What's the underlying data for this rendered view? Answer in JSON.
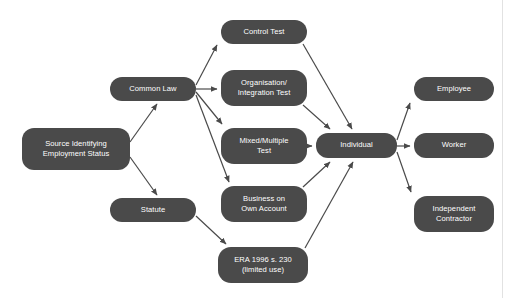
{
  "diagram": {
    "node_fill": "#4a4a4a",
    "node_text_color": "#ffffff",
    "edge_color": "#4a4a4a",
    "background": "#ffffff",
    "divider_color": "#e2e2e2",
    "nodes": [
      {
        "id": "source",
        "label": "Source Identifying\nEmployment Status",
        "x": 22,
        "y": 128,
        "w": 108,
        "h": 42
      },
      {
        "id": "common_law",
        "label": "Common Law",
        "x": 110,
        "y": 77,
        "w": 86,
        "h": 24
      },
      {
        "id": "statute",
        "label": "Statute",
        "x": 110,
        "y": 198,
        "w": 86,
        "h": 24
      },
      {
        "id": "control_test",
        "label": "Control Test",
        "x": 221,
        "y": 20,
        "w": 86,
        "h": 24
      },
      {
        "id": "organisation_test",
        "label": "Organisation/\nIntegration Test",
        "x": 221,
        "y": 70,
        "w": 86,
        "h": 36
      },
      {
        "id": "mixed_test",
        "label": "Mixed/Multiple\nTest",
        "x": 221,
        "y": 128,
        "w": 86,
        "h": 36
      },
      {
        "id": "business_own_account",
        "label": "Business on\nOwn Account",
        "x": 221,
        "y": 186,
        "w": 86,
        "h": 36
      },
      {
        "id": "era_1996",
        "label": "ERA 1996 s. 230\n(limited use)",
        "x": 218,
        "y": 247,
        "w": 90,
        "h": 36
      },
      {
        "id": "individual",
        "label": "Individual",
        "x": 316,
        "y": 133,
        "w": 81,
        "h": 25
      },
      {
        "id": "employee",
        "label": "Employee",
        "x": 414,
        "y": 77,
        "w": 80,
        "h": 24
      },
      {
        "id": "worker",
        "label": "Worker",
        "x": 414,
        "y": 133,
        "w": 80,
        "h": 25
      },
      {
        "id": "independent_contractor",
        "label": "Independent\nContractor",
        "x": 414,
        "y": 196,
        "w": 80,
        "h": 36
      }
    ],
    "edges": [
      {
        "from": "source",
        "to": "common_law"
      },
      {
        "from": "source",
        "to": "statute"
      },
      {
        "from": "common_law",
        "to": "control_test"
      },
      {
        "from": "common_law",
        "to": "organisation_test"
      },
      {
        "from": "common_law",
        "to": "mixed_test"
      },
      {
        "from": "common_law",
        "to": "business_own_account"
      },
      {
        "from": "statute",
        "to": "era_1996"
      },
      {
        "from": "control_test",
        "to": "individual"
      },
      {
        "from": "organisation_test",
        "to": "individual"
      },
      {
        "from": "mixed_test",
        "to": "individual"
      },
      {
        "from": "business_own_account",
        "to": "individual"
      },
      {
        "from": "era_1996",
        "to": "individual"
      },
      {
        "from": "individual",
        "to": "employee"
      },
      {
        "from": "individual",
        "to": "worker"
      },
      {
        "from": "individual",
        "to": "independent_contractor"
      }
    ]
  }
}
